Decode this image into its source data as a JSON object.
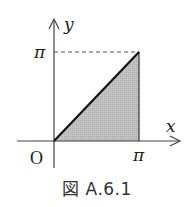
{
  "figure": {
    "caption": "図 A.6.1",
    "axes": {
      "x_label": "x",
      "y_label": "y",
      "origin_label": "O",
      "x_tick_label": "π",
      "y_tick_label": "π"
    },
    "region": {
      "description": "shaded triangle bounded by y = x, x = π and the x-axis",
      "vertices": [
        [
          0,
          0
        ],
        [
          3.14159,
          0
        ],
        [
          3.14159,
          3.14159
        ]
      ],
      "fill_color": "#b8b8b8",
      "edge_color": "#111111"
    },
    "guide_line": {
      "style": "dashed",
      "from": [
        0,
        3.14159
      ],
      "to": [
        3.14159,
        3.14159
      ]
    },
    "colors": {
      "axis": "#444444",
      "line": "#111111",
      "shade": "#b8b8b8"
    }
  }
}
